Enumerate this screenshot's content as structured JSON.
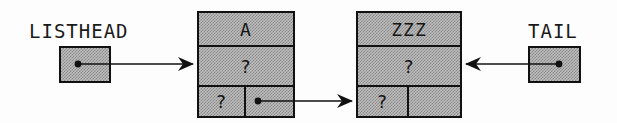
{
  "diagram": {
    "type": "linked-list-node-diagram",
    "colors": {
      "fill": "#bdbdbd",
      "fill_dither_dark": "#8a8a8a",
      "stroke": "#111111",
      "text": "#151515",
      "background": "#fdfdfd"
    }
  },
  "pointers": [
    {
      "id": "listhead",
      "label": "LISTHEAD",
      "label_x": 29,
      "label_y": 22,
      "box": {
        "x": 59,
        "y": 46,
        "w": 52,
        "h": 37
      },
      "target": "node-a",
      "direction": "right"
    },
    {
      "id": "tail",
      "label": "TAIL",
      "label_x": 528,
      "label_y": 22,
      "box": {
        "x": 528,
        "y": 46,
        "w": 53,
        "h": 37
      },
      "target": "node-zzz",
      "direction": "left"
    }
  ],
  "nodes": [
    {
      "id": "node-a",
      "x": 197,
      "y": 11,
      "w": 98,
      "h": 107,
      "rows": {
        "key": "A",
        "data": "?",
        "left": "?",
        "right": ""
      },
      "next_pointer": "node-zzz",
      "next_is_null": false
    },
    {
      "id": "node-zzz",
      "x": 356,
      "y": 11,
      "w": 106,
      "h": 107,
      "rows": {
        "key": "ZZZ",
        "data": "?",
        "left": "?",
        "right": ""
      },
      "next_pointer": null,
      "next_is_null": true
    }
  ],
  "edges": [
    {
      "id": "edge-listhead-to-a",
      "from": "listhead",
      "to": "node-a",
      "from_dot": {
        "x": 78,
        "y": 64
      },
      "to_point": {
        "x": 197,
        "y": 64
      },
      "arrowhead": "right"
    },
    {
      "id": "edge-a-to-zzz",
      "from": "node-a",
      "to": "node-zzz",
      "from_dot": {
        "x": 258,
        "y": 101
      },
      "to_point": {
        "x": 356,
        "y": 101
      },
      "arrowhead": "right"
    },
    {
      "id": "edge-tail-to-zzz",
      "from": "tail",
      "to": "node-zzz",
      "from_dot": {
        "x": 559,
        "y": 64
      },
      "to_point": {
        "x": 462,
        "y": 64
      },
      "arrowhead": "left"
    }
  ]
}
